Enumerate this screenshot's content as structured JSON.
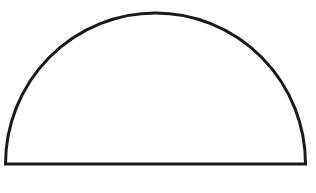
{
  "diagram": {
    "shape": "semicircle",
    "orientation": "flat-side-down",
    "stroke_color": "#1a1a1a",
    "fill_color": "#ffffff",
    "background": "#ffffff",
    "labels": []
  }
}
